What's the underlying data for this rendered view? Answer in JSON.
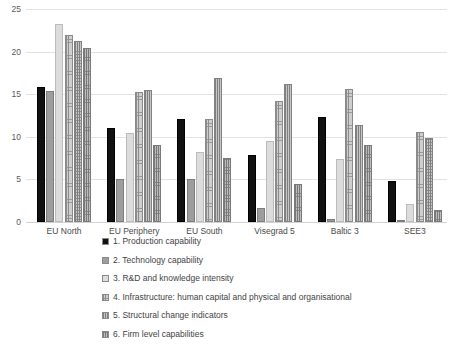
{
  "chart_data": {
    "type": "bar",
    "title": "",
    "xlabel": "",
    "ylabel": "",
    "ylim": [
      0,
      25
    ],
    "yticks": [
      0,
      5,
      10,
      15,
      20,
      25
    ],
    "grid": true,
    "legend_position": "bottom-left",
    "categories": [
      "EU North",
      "EU Periphery",
      "EU South",
      "Visegrad 5",
      "Baltic 3",
      "SEE3"
    ],
    "series": [
      {
        "name": "1. Production capability",
        "color": "#111111",
        "values": [
          15.8,
          11.0,
          12.1,
          7.9,
          12.3,
          4.8
        ]
      },
      {
        "name": "2.  Technology capability",
        "color": "#9d9d9d",
        "values": [
          15.4,
          5.0,
          5.1,
          1.7,
          0.4,
          0.2
        ]
      },
      {
        "name": "3. R&D and knowledge intensity",
        "color": "#dcdcdc",
        "values": [
          23.2,
          10.4,
          8.2,
          9.5,
          7.4,
          2.1
        ]
      },
      {
        "name": "4. Infrastructure:  human capital and physical and organisational",
        "color": "#cfcfcf",
        "values": [
          22.0,
          15.3,
          12.1,
          14.2,
          15.6,
          10.6
        ]
      },
      {
        "name": "5. Structural change indicators",
        "color": "#c6c6c6",
        "values": [
          21.2,
          15.5,
          16.9,
          16.2,
          11.4,
          9.9
        ]
      },
      {
        "name": "6. Firm level capabilities",
        "color": "#bdbdbd",
        "values": [
          20.4,
          9.0,
          7.5,
          4.5,
          9.0,
          1.4
        ]
      }
    ]
  }
}
